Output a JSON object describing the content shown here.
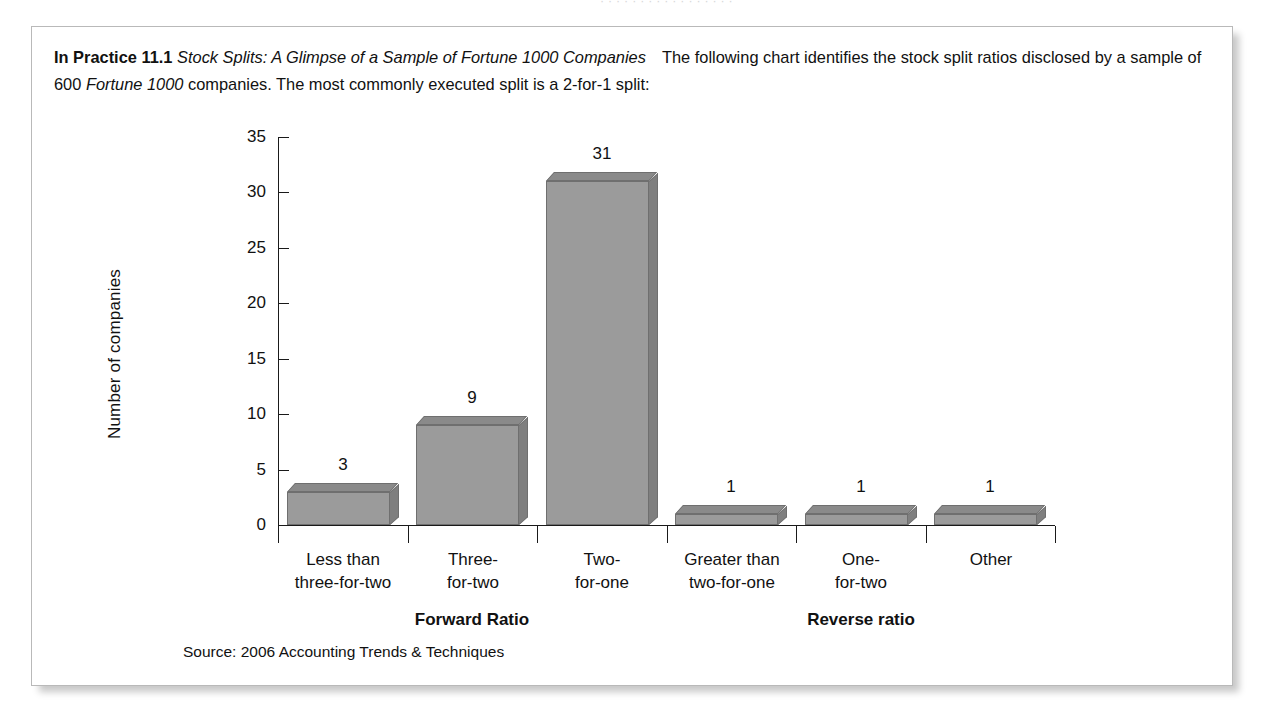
{
  "page": {
    "top_bleed_text": "· · · · · · · · · · · · · · · · ·"
  },
  "box": {
    "label": "In Practice 11.1",
    "title_italic": "Stock Splits: A Glimpse of a Sample of Fortune 1000 Companies",
    "body_part_1": "The following chart identifies the stock split ratios disclosed by a sample of 600 ",
    "body_italic": "Fortune 1000",
    "body_part_2": " companies. The most commonly executed split is a 2-for-1 split:",
    "source": "Source: 2006 Accounting Trends & Techniques"
  },
  "chart_data": {
    "type": "bar",
    "title": "",
    "xlabel": "",
    "ylabel": "Number of companies",
    "ylim": [
      0,
      35
    ],
    "ytick_step": 5,
    "ytick_labels": [
      "0",
      "5",
      "10",
      "15",
      "20",
      "25",
      "30",
      "35"
    ],
    "grid": false,
    "legend": "none",
    "style": "3d-bar",
    "bar_color": "#9b9b9b",
    "bar_edge_color": "#6f6f6f",
    "axis_color": "#1a1a1a",
    "categories": [
      "Less than\nthree-for-two",
      "Three-\nfor-two",
      "Two-\nfor-one",
      "Greater than\ntwo-for-one",
      "One-\nfor-two",
      "Other"
    ],
    "category_lines": [
      [
        "Less than",
        "three-for-two"
      ],
      [
        "Three-",
        "for-two"
      ],
      [
        "Two-",
        "for-one"
      ],
      [
        "Greater than",
        "two-for-one"
      ],
      [
        "One-",
        "for-two"
      ],
      [
        "Other"
      ]
    ],
    "values": [
      3,
      9,
      31,
      1,
      1,
      1
    ],
    "value_labels": [
      "3",
      "9",
      "31",
      "1",
      "1",
      "1"
    ],
    "groups": [
      {
        "label": "Forward Ratio",
        "categories": [
          0,
          1,
          2
        ]
      },
      {
        "label": "Reverse ratio",
        "categories": [
          3,
          4,
          5
        ]
      }
    ]
  }
}
